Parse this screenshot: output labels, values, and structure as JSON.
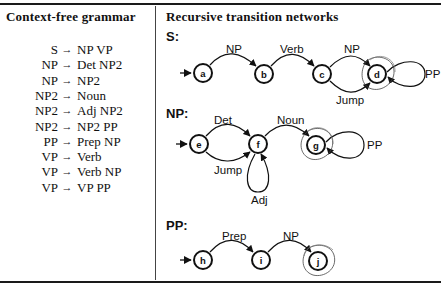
{
  "left_panel": {
    "title": "Context-free grammar",
    "rules": [
      {
        "lhs": "S",
        "arrow": "→",
        "rhs": "NP VP"
      },
      {
        "lhs": "NP",
        "arrow": "→",
        "rhs": "Det NP2"
      },
      {
        "lhs": "NP",
        "arrow": "→",
        "rhs": "NP2"
      },
      {
        "lhs": "NP2",
        "arrow": "→",
        "rhs": "Noun"
      },
      {
        "lhs": "NP2",
        "arrow": "→",
        "rhs": "Adj NP2"
      },
      {
        "lhs": "NP2",
        "arrow": "→",
        "rhs": "NP2 PP"
      },
      {
        "lhs": "PP",
        "arrow": "→",
        "rhs": "Prep NP"
      },
      {
        "lhs": "VP",
        "arrow": "→",
        "rhs": "Verb"
      },
      {
        "lhs": "VP",
        "arrow": "→",
        "rhs": "Verb NP"
      },
      {
        "lhs": "VP",
        "arrow": "→",
        "rhs": "VP PP"
      }
    ]
  },
  "right_panel": {
    "title": "Recursive transition networks",
    "networks": [
      {
        "label": "S:",
        "nodes": [
          "a",
          "b",
          "c",
          "d"
        ],
        "start": "a",
        "final": [
          "d"
        ],
        "edges": [
          {
            "from": "a",
            "to": "b",
            "label": "NP"
          },
          {
            "from": "b",
            "to": "c",
            "label": "Verb"
          },
          {
            "from": "c",
            "to": "d",
            "label": "NP"
          },
          {
            "from": "c",
            "to": "d",
            "label": "Jump"
          },
          {
            "from": "d",
            "to": "d",
            "label": "PP"
          }
        ]
      },
      {
        "label": "NP:",
        "nodes": [
          "e",
          "f",
          "g"
        ],
        "start": "e",
        "final": [
          "g"
        ],
        "edges": [
          {
            "from": "e",
            "to": "f",
            "label": "Det"
          },
          {
            "from": "e",
            "to": "f",
            "label": "Jump"
          },
          {
            "from": "f",
            "to": "f",
            "label": "Adj"
          },
          {
            "from": "f",
            "to": "g",
            "label": "Noun"
          },
          {
            "from": "g",
            "to": "g",
            "label": "PP"
          }
        ]
      },
      {
        "label": "PP:",
        "nodes": [
          "h",
          "i",
          "j"
        ],
        "start": "h",
        "final": [
          "j"
        ],
        "edges": [
          {
            "from": "h",
            "to": "i",
            "label": "Prep"
          },
          {
            "from": "i",
            "to": "j",
            "label": "NP"
          }
        ]
      }
    ]
  }
}
